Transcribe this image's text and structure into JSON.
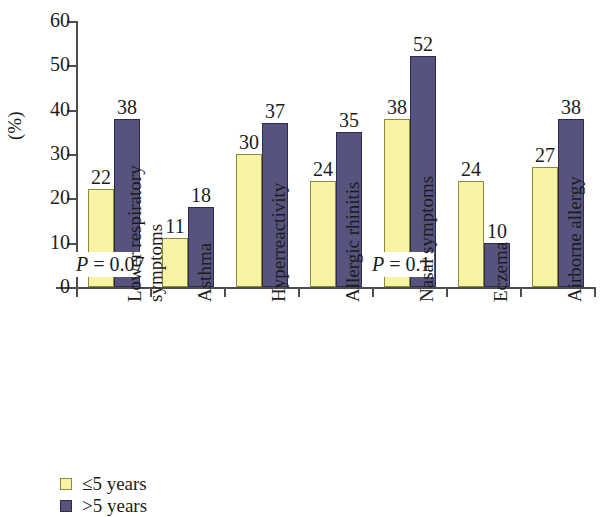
{
  "chart_data": {
    "type": "bar",
    "title": "",
    "xlabel": "",
    "ylabel": "(%)",
    "ylim": [
      0,
      60
    ],
    "yticks": [
      0,
      10,
      20,
      30,
      40,
      50,
      60
    ],
    "grid": false,
    "legend_position": "bottom-left",
    "categories": [
      "Lower respiratory symptoms",
      "Asthma",
      "Hyperreactivity",
      "Allergic rhinitis",
      "Nasal symptoms",
      "Eczema",
      "Airborne allergy"
    ],
    "category_lines": [
      [
        "Lower respiratory",
        "symptoms"
      ],
      [
        "Asthma"
      ],
      [
        "Hyperreactivity"
      ],
      [
        "Allergic rhinitis"
      ],
      [
        "Nasal symptoms"
      ],
      [
        "Eczema"
      ],
      [
        "Airborne allergy"
      ]
    ],
    "series": [
      {
        "name": "≤5 years",
        "color": "#f7f4a4",
        "values": [
          22,
          11,
          30,
          24,
          38,
          24,
          27
        ]
      },
      {
        "name": ">5 years",
        "color": "#57537f",
        "values": [
          38,
          18,
          37,
          35,
          52,
          10,
          38
        ]
      }
    ],
    "annotations": [
      {
        "text": "P = 0.07",
        "label_italic": "P",
        "label_rest": " = 0.07",
        "category": "Lower respiratory symptoms"
      },
      {
        "text": "P = 0.1",
        "label_italic": "P",
        "label_rest": " = 0.1",
        "category": "Nasal symptoms"
      }
    ]
  },
  "axis": {
    "y_title": "(%)",
    "tick_labels": [
      "0",
      "10",
      "20",
      "30",
      "40",
      "50",
      "60"
    ]
  },
  "legend": {
    "items": [
      {
        "label": "≤5 years",
        "swatch": "low"
      },
      {
        "label": ">5 years",
        "swatch": "high"
      }
    ]
  },
  "values": {
    "s0": [
      "22",
      "11",
      "30",
      "24",
      "38",
      "24",
      "27"
    ],
    "s1": [
      "38",
      "18",
      "37",
      "35",
      "52",
      "10",
      "38"
    ]
  },
  "annotations": {
    "a0_italic": "P",
    "a0_rest": " = 0.07",
    "a1_italic": "P",
    "a1_rest": " = 0.1"
  }
}
